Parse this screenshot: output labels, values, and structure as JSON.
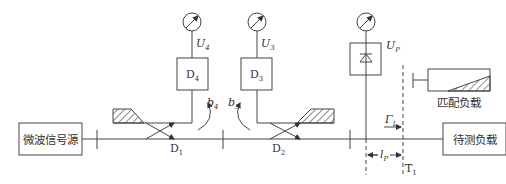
{
  "diagram": {
    "type": "reflectometer-measurement-setup",
    "source_box": {
      "label": "微波信号源"
    },
    "load_box": {
      "label": "待测负载"
    },
    "matched_load": {
      "label": "匹配负载"
    },
    "couplers": [
      {
        "id": "D1",
        "label": "D",
        "sub": "1"
      },
      {
        "id": "D2",
        "label": "D",
        "sub": "2"
      }
    ],
    "detectors": [
      {
        "id": "D4",
        "label": "D",
        "sub": "4",
        "meter": {
          "label": "U",
          "sub": "4"
        },
        "wave": {
          "label": "b",
          "sub": "4"
        }
      },
      {
        "id": "D3",
        "label": "D",
        "sub": "3",
        "meter": {
          "label": "U",
          "sub": "3"
        },
        "wave": {
          "label": "b",
          "sub": "3"
        }
      }
    ],
    "probe": {
      "meter": {
        "label": "U",
        "sub": "P"
      },
      "distance": {
        "label": "l",
        "sub": "P"
      }
    },
    "reflection": {
      "label": "Γ",
      "sub": "L"
    },
    "reference_plane": {
      "label": "T",
      "sub": "1"
    },
    "colors": {
      "line": "#444444",
      "text": "#333333",
      "background": "#ffffff"
    }
  }
}
